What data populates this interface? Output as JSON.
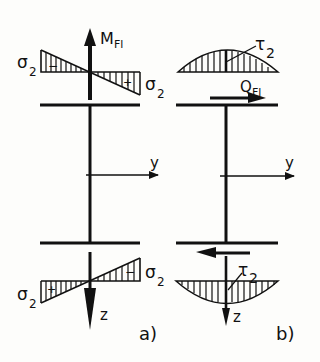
{
  "diagram": {
    "panel_a": {
      "caption": "a)",
      "moment_label": "M",
      "moment_sub": "Fl",
      "sigma_label": "σ",
      "sigma_sub": "2",
      "axis_y": "y",
      "axis_z": "z",
      "sign_top_left": "−",
      "sign_top_right": "+",
      "sign_bottom_left": "+",
      "sign_bottom_right": "−"
    },
    "panel_b": {
      "caption": "b)",
      "shear_label": "Q",
      "shear_sub": "Fl",
      "tau_label": "τ",
      "tau_sub": "2",
      "axis_y": "y",
      "axis_z": "z"
    },
    "colors": {
      "ink": "#111111",
      "paper": "#fdfdfb"
    }
  }
}
